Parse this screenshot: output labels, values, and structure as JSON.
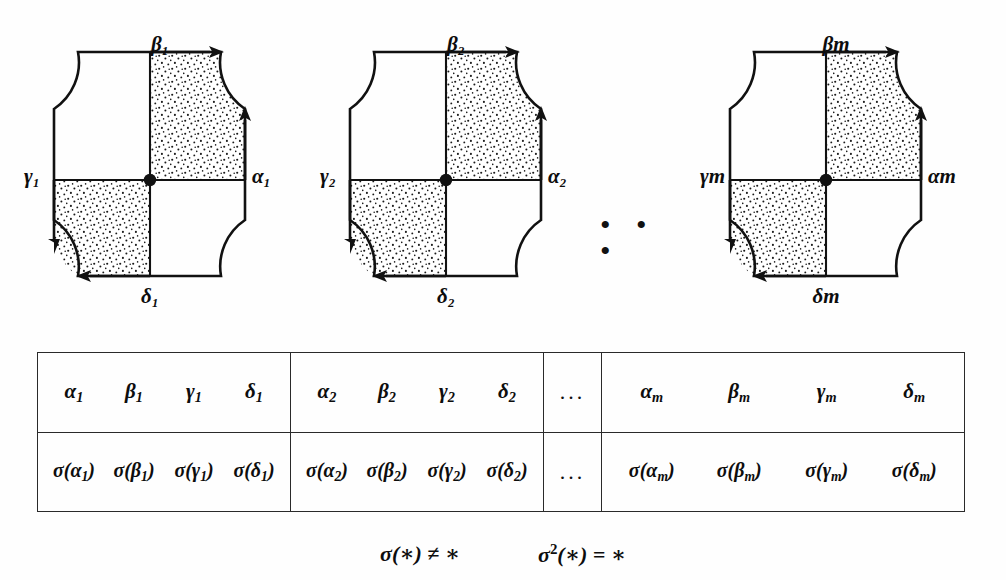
{
  "figure": {
    "diagrams": [
      {
        "index": "1",
        "labels": {
          "alpha": "α₁",
          "beta": "β₁",
          "gamma": "γ₁",
          "delta": "δ₁"
        },
        "arrows": {
          "top": "right",
          "right": "up",
          "bottom": "left",
          "left": "down"
        },
        "shaded_quadrants": [
          "top-right",
          "bottom-left"
        ],
        "center_marker": "basepoint-dot"
      },
      {
        "index": "2",
        "labels": {
          "alpha": "α₂",
          "beta": "β₂",
          "gamma": "γ₂",
          "delta": "δ₂"
        },
        "arrows": {
          "top": "right",
          "right": "up",
          "bottom": "left",
          "left": "down"
        },
        "shaded_quadrants": [
          "top-right",
          "bottom-left"
        ],
        "center_marker": "basepoint-dot"
      },
      {
        "index": "m",
        "labels": {
          "alpha": "αm",
          "beta": "βm",
          "gamma": "γm",
          "delta": "δm"
        },
        "arrows": {
          "top": "right",
          "right": "up",
          "bottom": "left",
          "left": "down"
        },
        "shaded_quadrants": [
          "top-right",
          "bottom-left"
        ],
        "center_marker": "basepoint-dot"
      }
    ],
    "row_ellipsis": "• • •"
  },
  "table": {
    "blocks": [
      {
        "kind": "generators",
        "top": [
          "α",
          "β",
          "γ",
          "δ"
        ],
        "subscripts": [
          "1",
          "1",
          "1",
          "1"
        ],
        "bottom": [
          "σ(α",
          "σ(β",
          "σ(γ",
          "σ(δ"
        ],
        "bottom_close": [
          ")",
          ")",
          ")",
          ")"
        ]
      },
      {
        "kind": "generators",
        "top": [
          "α",
          "β",
          "γ",
          "δ"
        ],
        "subscripts": [
          "2",
          "2",
          "2",
          "2"
        ],
        "bottom": [
          "σ(α",
          "σ(β",
          "σ(γ",
          "σ(δ"
        ],
        "bottom_close": [
          ")",
          ")",
          ")",
          ")"
        ]
      },
      {
        "kind": "ellipsis",
        "top": [
          "..."
        ],
        "bottom": [
          "..."
        ]
      },
      {
        "kind": "generators",
        "top": [
          "α",
          "β",
          "γ",
          "δ"
        ],
        "subscripts": [
          "m",
          "m",
          "m",
          "m"
        ],
        "bottom": [
          "σ(α",
          "σ(β",
          "σ(γ",
          "σ(δ"
        ],
        "bottom_close": [
          ")",
          ")",
          ")",
          ")"
        ]
      }
    ]
  },
  "formulas": {
    "first": {
      "sigma": "σ",
      "arg": "(∗)",
      "relation": "≠",
      "rhs": "∗"
    },
    "second": {
      "sigma": "σ",
      "power": "2",
      "arg": "(∗)",
      "relation": "=",
      "rhs": "∗"
    }
  },
  "style": {
    "ink": "#111111",
    "background": "#fefefe",
    "stipple": "#1a1a1a"
  }
}
